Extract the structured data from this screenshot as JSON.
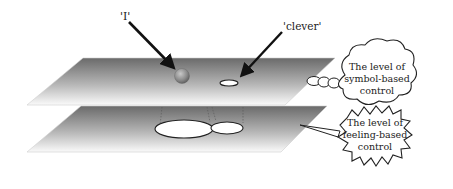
{
  "diagram": {
    "type": "layered-planes",
    "labels": {
      "word_i": "'I'",
      "word_clever": "'clever'"
    },
    "callouts": {
      "symbol": {
        "line1": "The level of",
        "line2": "symbol-based",
        "line3": "control",
        "shape": "thought-cloud"
      },
      "feeling": {
        "line1": "The level of",
        "line2": "feeling-based",
        "line3": "control",
        "shape": "starburst"
      }
    },
    "planes": [
      {
        "name": "symbol-based-plane",
        "contains": [
          "sphere 'I'",
          "small ellipse 'clever'"
        ]
      },
      {
        "name": "feeling-based-plane",
        "contains": [
          "large ellipse",
          "medium ellipse"
        ]
      }
    ],
    "colors": {
      "plane_dark": "#6e6e6e",
      "plane_light": "#ffffff",
      "arrow": "#111111",
      "sphere": "#8a8a8a",
      "outline": "#222222"
    }
  }
}
